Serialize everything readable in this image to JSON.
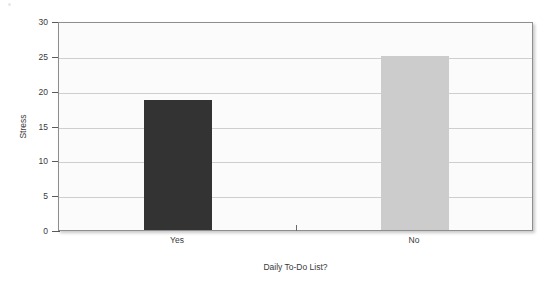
{
  "chart_data": {
    "type": "bar",
    "title": "",
    "xlabel": "Daily To-Do List?",
    "ylabel": "Stress",
    "categories": [
      "Yes",
      "No"
    ],
    "values": [
      18.6,
      25.0
    ],
    "ylim": [
      0,
      30
    ],
    "ytick_labels": [
      "0",
      "5",
      "10",
      "15",
      "20",
      "25",
      "30"
    ],
    "ytick_values": [
      0,
      5,
      10,
      15,
      20,
      25,
      30
    ],
    "grid": true,
    "legend": "none",
    "bar_colors": [
      "#333333",
      "#cccccc"
    ],
    "plot_background": "#fbfbfb",
    "plot_border_color": "#8e8e8e",
    "gridline_color": "#cfcfcf",
    "text_color": "#3a3a3a"
  },
  "axes": {
    "y_title": "Stress",
    "x_title": "Daily To-Do List?"
  },
  "bars": [
    {
      "label": "Yes",
      "value": 18.6,
      "color": "#333333"
    },
    {
      "label": "No",
      "value": 25.0,
      "color": "#cccccc"
    }
  ]
}
